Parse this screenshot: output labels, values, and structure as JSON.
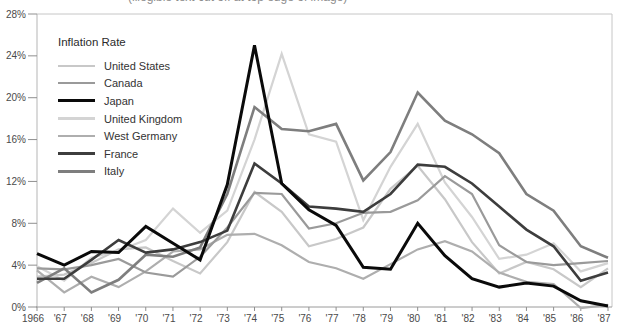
{
  "page": {
    "top_edge_cropped_text": "(illegible text cut off at top edge of image)"
  },
  "chart_data": {
    "type": "line",
    "legend_title": "Inflation Rate",
    "x_labels": [
      "1966",
      "'67",
      "'68",
      "'69",
      "'70",
      "'71",
      "'72",
      "'73",
      "'74",
      "'75",
      "'76",
      "'77",
      "'78",
      "'79",
      "'80",
      "'81",
      "'82",
      "'83",
      "'84",
      "'85",
      "'86",
      "'87"
    ],
    "y_tick_labels": [
      "0%",
      "4%",
      "8%",
      "12%",
      "16%",
      "20%",
      "24%",
      "28%"
    ],
    "ylim": [
      0,
      28
    ],
    "y_tick_step": 4,
    "grid": false,
    "legend_position": "top-left-inside",
    "axis_color": "#9a9a9a",
    "border_color": "#c6c6c6",
    "series": [
      {
        "name": "United States",
        "color": "#c8c8c8",
        "line_width": 2.2,
        "values": [
          2.9,
          3.1,
          4.2,
          5.5,
          5.7,
          4.4,
          3.2,
          6.2,
          11.0,
          9.1,
          5.8,
          6.5,
          7.6,
          11.3,
          13.5,
          10.3,
          6.2,
          3.2,
          4.3,
          3.6,
          1.9,
          3.7
        ]
      },
      {
        "name": "Canada",
        "color": "#9a9a9a",
        "line_width": 2.2,
        "values": [
          3.7,
          3.6,
          4.0,
          4.6,
          3.3,
          2.9,
          4.8,
          7.6,
          10.9,
          10.8,
          7.5,
          8.0,
          9.0,
          9.1,
          10.2,
          12.5,
          10.8,
          5.9,
          4.3,
          4.0,
          4.2,
          4.4
        ]
      },
      {
        "name": "Japan",
        "color": "#0a0a0a",
        "line_width": 3,
        "values": [
          5.1,
          4.0,
          5.3,
          5.2,
          7.7,
          6.1,
          4.5,
          11.7,
          25.0,
          11.8,
          9.3,
          7.8,
          3.8,
          3.6,
          8.0,
          4.9,
          2.7,
          1.9,
          2.3,
          2.0,
          0.6,
          0.1
        ]
      },
      {
        "name": "United Kingdom",
        "color": "#d4d4d4",
        "line_width": 2.2,
        "values": [
          3.9,
          2.5,
          4.7,
          5.4,
          6.4,
          9.4,
          7.1,
          9.2,
          16.0,
          24.2,
          16.5,
          15.8,
          8.3,
          13.4,
          17.5,
          11.9,
          8.6,
          4.6,
          5.0,
          6.1,
          3.4,
          4.2
        ]
      },
      {
        "name": "West Germany",
        "color": "#aeaeae",
        "line_width": 2.2,
        "values": [
          3.5,
          1.4,
          2.9,
          1.9,
          3.4,
          5.3,
          5.5,
          6.9,
          7.0,
          5.9,
          4.3,
          3.7,
          2.7,
          4.1,
          5.5,
          6.3,
          5.3,
          3.3,
          2.4,
          2.2,
          -0.1,
          0.2
        ]
      },
      {
        "name": "France",
        "color": "#3d3d3d",
        "line_width": 2.6,
        "values": [
          2.7,
          2.7,
          4.5,
          6.4,
          5.2,
          5.5,
          6.2,
          7.3,
          13.7,
          11.8,
          9.6,
          9.4,
          9.1,
          10.8,
          13.6,
          13.4,
          11.8,
          9.6,
          7.4,
          5.8,
          2.5,
          3.3
        ]
      },
      {
        "name": "Italy",
        "color": "#7e7e7e",
        "line_width": 2.6,
        "values": [
          2.3,
          3.7,
          1.4,
          2.6,
          5.0,
          4.8,
          5.7,
          10.8,
          19.1,
          17.0,
          16.8,
          17.5,
          12.1,
          14.8,
          20.5,
          17.8,
          16.5,
          14.7,
          10.8,
          9.2,
          5.8,
          4.7
        ]
      }
    ]
  }
}
